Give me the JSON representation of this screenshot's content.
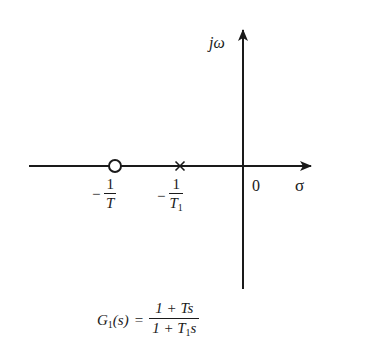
{
  "figure": {
    "type": "s-plane pole-zero plot",
    "axes": {
      "imaginary_axis_label": "jω",
      "real_axis_label": "σ",
      "origin_label": "0"
    },
    "markers": [
      {
        "kind": "zero",
        "symbol": "circle",
        "label_sign": "−",
        "label_numerator": "1",
        "label_denominator": "T",
        "label_denominator_sub": ""
      },
      {
        "kind": "pole",
        "symbol": "cross",
        "label_sign": "−",
        "label_numerator": "1",
        "label_denominator": "T",
        "label_denominator_sub": "1"
      }
    ],
    "equation": {
      "lhs_func": "G",
      "lhs_sub": "1",
      "lhs_arg": "(s)",
      "equals": "=",
      "numerator": "1 + Ts",
      "denominator_prefix": "1 + T",
      "denominator_sub": "1",
      "denominator_suffix": "s"
    }
  },
  "colors": {
    "ink": "#1a1a1a",
    "background": "#ffffff"
  }
}
